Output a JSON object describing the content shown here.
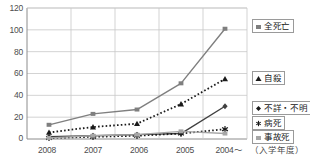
{
  "chart_data": {
    "type": "line",
    "title": "",
    "subtitle": "",
    "xlabel": "(入学年度)",
    "ylabel": "",
    "categories": [
      "2008",
      "2007",
      "2006",
      "2005",
      "2004～"
    ],
    "ylim": [
      0,
      120
    ],
    "yticks": [
      0,
      20,
      40,
      60,
      80,
      100,
      120
    ],
    "grid": true,
    "legend_position": "right",
    "series": [
      {
        "name": "全死亡",
        "marker": "square",
        "color": "#7f7f7f",
        "line_style": "solid",
        "values": [
          13,
          23,
          27,
          51,
          101
        ]
      },
      {
        "name": "自殺",
        "marker": "triangle",
        "color": "#1a1a1a",
        "line_style": "dotted",
        "values": [
          6,
          11,
          14,
          32,
          55
        ]
      },
      {
        "name": "不詳・不明",
        "marker": "diamond",
        "color": "#404040",
        "line_style": "solid",
        "values": [
          2,
          3,
          4,
          5,
          30
        ]
      },
      {
        "name": "病死",
        "marker": "asterisk",
        "color": "#1a1a1a",
        "line_style": "dotted",
        "values": [
          1,
          2,
          3,
          5,
          9
        ]
      },
      {
        "name": "事故死",
        "marker": "square",
        "color": "#a6a6a6",
        "line_style": "solid",
        "values": [
          1,
          3,
          4,
          7,
          5
        ]
      }
    ]
  },
  "axis": {
    "y_labels": [
      "120",
      "100",
      "80",
      "60",
      "40",
      "20",
      "0"
    ],
    "x_labels": [
      "2008",
      "2007",
      "2006",
      "2005",
      "2004～"
    ],
    "x_axis_caption": "（入学年度）"
  },
  "legend": {
    "entries": [
      {
        "label": "全死亡",
        "icon": "square-marker-icon"
      },
      {
        "label": "自殺",
        "icon": "triangle-marker-icon"
      },
      {
        "label": "不詳・不明",
        "icon": "diamond-marker-icon"
      },
      {
        "label": "病死",
        "icon": "asterisk-marker-icon"
      },
      {
        "label": "事故死",
        "icon": "square-marker-icon"
      }
    ]
  },
  "colors": {
    "grid": "#c8c8c8",
    "axis": "#8c8c8c",
    "text": "#4d4d4d",
    "series_all_deaths": "#7f7f7f",
    "series_suicide": "#1a1a1a",
    "series_unknown": "#404040",
    "series_illness": "#1a1a1a",
    "series_accident": "#a6a6a6"
  }
}
